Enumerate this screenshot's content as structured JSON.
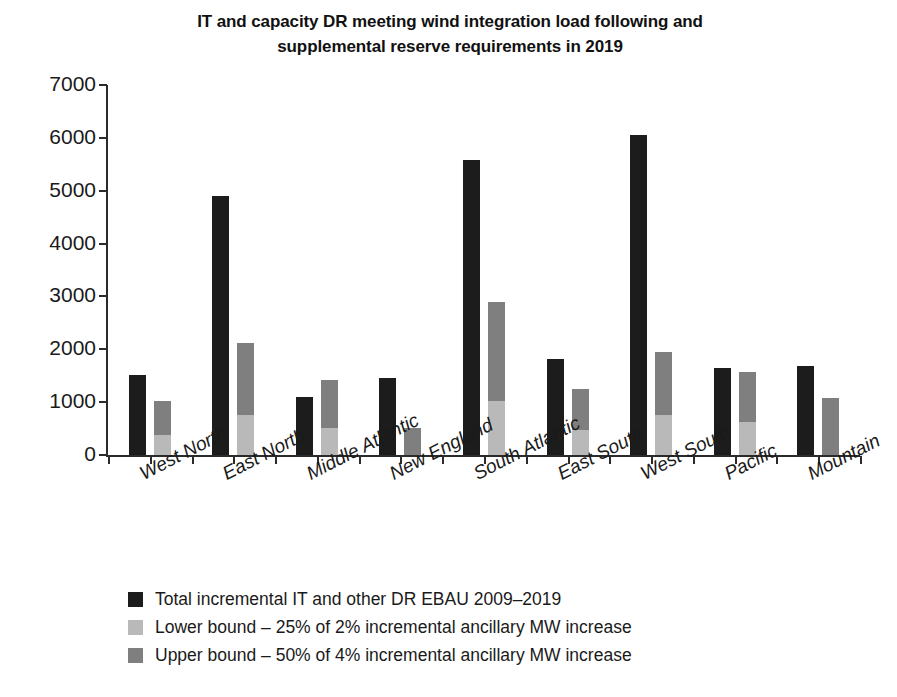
{
  "chart_data": {
    "type": "bar",
    "subtype": "grouped-with-stacked-secondary",
    "title": "IT and capacity DR meeting wind integration load following and supplemental reserve requirements in 2019",
    "title_lines": [
      "IT and capacity DR meeting wind integration load following and",
      "supplemental reserve requirements in 2019"
    ],
    "xlabel": "",
    "ylabel": "",
    "ylim": [
      0,
      7000
    ],
    "yticks": [
      0,
      1000,
      2000,
      3000,
      4000,
      5000,
      6000,
      7000
    ],
    "ytick_labels": [
      "0",
      "1000",
      "2000",
      "3000",
      "4000",
      "5000",
      "6000",
      "7000"
    ],
    "grid": false,
    "legend_position": "below-center",
    "categories": [
      "West North",
      "East North",
      "Middle Atlantic",
      "New England",
      "South Atlantic",
      "East South",
      "West South",
      "Pacific",
      "Mountain"
    ],
    "series": [
      {
        "name": "Total incremental IT and other DR EBAU 2009–2019",
        "color": "#1c1c1c",
        "kind": "bar",
        "values": [
          1520,
          4900,
          1090,
          1450,
          5590,
          1810,
          6050,
          1650,
          1680
        ]
      },
      {
        "name": "Lower bound – 25% of  2% incremental ancillary MW increase",
        "color": "#b9b9b9",
        "kind": "stack-bottom",
        "values": [
          380,
          750,
          510,
          0,
          1020,
          480,
          750,
          620,
          0
        ]
      },
      {
        "name": "Upper bound – 50% of  4% incremental ancillary MW increase",
        "color": "#7f7f7f",
        "kind": "stack-top-cumulative",
        "values": [
          1020,
          2120,
          1420,
          520,
          2900,
          1240,
          1940,
          1580,
          1080
        ]
      }
    ]
  },
  "legend": {
    "items": [
      {
        "label": "Total incremental IT and other DR EBAU 2009–2019",
        "color": "#1c1c1c"
      },
      {
        "label": "Lower bound – 25% of  2% incremental ancillary MW increase",
        "color": "#b9b9b9"
      },
      {
        "label": "Upper bound – 50% of  4% incremental ancillary MW increase",
        "color": "#7f7f7f"
      }
    ]
  }
}
